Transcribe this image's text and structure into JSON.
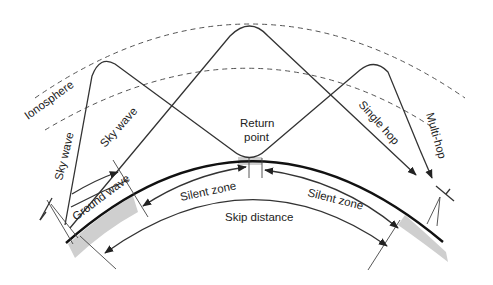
{
  "diagram": {
    "type": "radio wave propagation",
    "labels": {
      "ionosphere": "Ionosphere",
      "sky_wave_left": "Sky wave",
      "sky_wave_mid": "Sky wave",
      "ground_wave": "Ground wave",
      "return_point_line1": "Return",
      "return_point_line2": "point",
      "silent_zone_left": "Silent zone",
      "silent_zone_right": "Silent zone",
      "skip_distance": "Skip distance",
      "single_hop": "Single hop",
      "multi_hop": "Multi-hop"
    },
    "elements": [
      "transmitter-antenna",
      "receiver-antenna",
      "earth-surface",
      "ionosphere-lower-boundary",
      "ionosphere-upper-boundary",
      "sky-wave-path-single-hop",
      "sky-wave-path-multi-hop",
      "ground-wave-arrow",
      "silent-zone-arrows",
      "skip-distance-arrow"
    ],
    "colors": {
      "line": "#333333",
      "earth": "#111111",
      "shade": "#cfcfcf",
      "background": "#ffffff"
    }
  }
}
